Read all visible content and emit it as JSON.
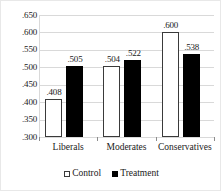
{
  "chart_data": {
    "type": "bar",
    "title": "",
    "xlabel": "",
    "ylabel": "",
    "categories": [
      "Liberals",
      "Moderates",
      "Conservatives"
    ],
    "series": [
      {
        "name": "Control",
        "color": "#ffffff",
        "values": [
          0.408,
          0.504,
          0.6
        ],
        "labels": [
          ".408",
          ".504",
          ".600"
        ]
      },
      {
        "name": "Treatment",
        "color": "#000000",
        "values": [
          0.505,
          0.522,
          0.538
        ],
        "labels": [
          ".505",
          ".522",
          ".538"
        ]
      }
    ],
    "ylim": [
      0.3,
      0.65
    ],
    "yticks": [
      0.3,
      0.35,
      0.4,
      0.45,
      0.5,
      0.55,
      0.6,
      0.65
    ],
    "ytick_labels": [
      ".300",
      ".350",
      ".400",
      ".450",
      ".500",
      ".550",
      ".600",
      ".650"
    ],
    "grid": true,
    "legend_position": "bottom"
  },
  "legend": {
    "items": [
      {
        "label": "Control",
        "marker": "white-square-icon"
      },
      {
        "label": "Treatment",
        "marker": "black-square-icon"
      }
    ]
  }
}
